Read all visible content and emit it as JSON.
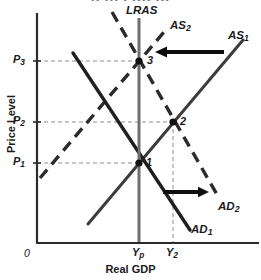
{
  "figure": {
    "type": "economics-ad-as-diagram",
    "width": 261,
    "height": 280,
    "background": "#ffffff"
  },
  "axes": {
    "y_label": "Price Level",
    "x_label": "Real GDP",
    "origin_label": "0",
    "axis_color": "#2b2b2b",
    "y_ticks": [
      {
        "name": "P3",
        "base": "P",
        "sub": "3",
        "y": 61
      },
      {
        "name": "P2",
        "base": "P",
        "sub": "2",
        "y": 122
      },
      {
        "name": "P1",
        "base": "P",
        "sub": "1",
        "y": 163
      }
    ],
    "x_ticks": [
      {
        "name": "Yp",
        "base": "Y",
        "sub": "p",
        "x": 139
      },
      {
        "name": "Y2",
        "base": "Y",
        "sub": "2",
        "x": 173
      }
    ]
  },
  "curves": [
    {
      "id": "lras",
      "label": "LRAS",
      "base": "LRAS",
      "sub": "",
      "style": "solid",
      "color": "#6e6e6e",
      "width": 3,
      "label_x": 126,
      "label_y": 6
    },
    {
      "id": "as1",
      "label": "AS1",
      "base": "AS",
      "sub": "1",
      "style": "solid",
      "color": "#3c3c3c",
      "width": 3,
      "label_x": 229,
      "label_y": 31
    },
    {
      "id": "as2",
      "label": "AS2",
      "base": "AS",
      "sub": "2",
      "style": "dashed",
      "color": "#2b2b2b",
      "width": 3.4,
      "label_x": 171,
      "label_y": 21
    },
    {
      "id": "ad1",
      "label": "AD1",
      "base": "AD",
      "sub": "1",
      "style": "solid",
      "color": "#1f1f1f",
      "width": 3.4,
      "label_x": 192,
      "label_y": 225
    },
    {
      "id": "ad2",
      "label": "AD2",
      "base": "AD",
      "sub": "2",
      "style": "dashed",
      "color": "#2b2b2b",
      "width": 3.4,
      "label_x": 220,
      "label_y": 202
    }
  ],
  "equilibria": [
    {
      "id": "point-1",
      "label": "1",
      "x": 139,
      "y": 163,
      "price": "P1",
      "output": "Yp"
    },
    {
      "id": "point-2",
      "label": "2",
      "x": 173,
      "y": 122,
      "price": "P2",
      "output": "Y2"
    },
    {
      "id": "point-3",
      "label": "3",
      "x": 139,
      "y": 61,
      "price": "P3",
      "output": "Yp"
    }
  ],
  "shift_arrows": [
    {
      "id": "as-shift-arrow",
      "direction": "left",
      "x1": 224,
      "x2": 157,
      "y": 52,
      "meaning": "AS1 shifts left to AS2"
    },
    {
      "id": "ad-shift-arrow",
      "direction": "right",
      "x1": 163,
      "x2": 208,
      "y": 192,
      "meaning": "AD1 shifts right to AD2"
    }
  ],
  "guides": {
    "color": "#8d8d8d",
    "style": "dashed"
  },
  "top_clipped_text": "•• ••• • •••• •••"
}
